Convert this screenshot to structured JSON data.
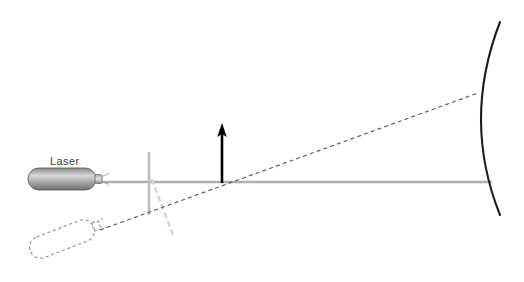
{
  "diagram": {
    "background_color": "#ffffff",
    "width": 524,
    "height": 282,
    "labels": {
      "laser": "Laser"
    },
    "colors": {
      "beam_gray": "#b0b0b0",
      "beamsplitter_gray": "#b8b8b8",
      "faint_dashed_gray": "#cccccc",
      "dashed_beam": "#5a5a5a",
      "ghost_outline": "#8c8c9c",
      "mirror_dark": "#1a1a1a",
      "arrow_black": "#000000",
      "label_color": "#3c3c3c",
      "laser_body_dark": "#7a7a7a",
      "laser_body_light": "#d8d8d8",
      "laser_body_mid": "#9a9a9a",
      "laser_outline": "#5e5e5e"
    },
    "elements": {
      "laser_source": {
        "name": "Laser",
        "x": 28,
        "y": 168,
        "width": 68,
        "height": 22,
        "orientation": "horizontal",
        "state": "actual"
      },
      "ghost_laser_source": {
        "name": "Laser (displaced position)",
        "x": 28,
        "y": 228,
        "width": 68,
        "height": 22,
        "rotation_deg": -21,
        "state": "ghost-dashed"
      },
      "horizontal_beam": {
        "name": "optical axis beam",
        "x1": 100,
        "y1": 182,
        "x2": 492,
        "y2": 182
      },
      "diagonal_beam": {
        "name": "tilted laser beam",
        "x1": 100,
        "y1": 230,
        "x2": 478,
        "y2": 93,
        "style": "dashed"
      },
      "beamsplitter": {
        "name": "vertical reference line",
        "x": 149,
        "y1": 152,
        "y2": 215
      },
      "faint_dashed_line": {
        "name": "displacement reference",
        "x1": 152,
        "y1": 180,
        "x2": 172,
        "y2": 234,
        "style": "dashed"
      },
      "up_arrow": {
        "name": "tilt direction arrow",
        "x": 222,
        "y_tail": 182,
        "y_head": 124
      },
      "concave_mirror": {
        "name": "concave mirror",
        "top": [
          500,
          22
        ],
        "vertex": [
          474,
          120
        ],
        "bottom": [
          500,
          215
        ]
      }
    }
  }
}
